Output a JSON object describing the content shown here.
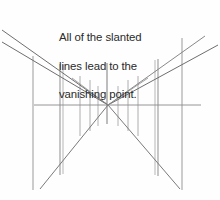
{
  "figure": {
    "background_color": "#fefefe",
    "width": 220,
    "height": 200
  },
  "caption": {
    "full_text": "All of the slanted lines lead to the vanishing point.",
    "lines": [
      "All of the slanted",
      "lines lead to the",
      "vanishing point."
    ],
    "color": "#2a2a2a",
    "font_size_px": 11.4
  },
  "chart_data": {
    "type": "diagram",
    "title": "All of the slanted lines lead to the vanishing point.",
    "vanishing_point": {
      "x": 108,
      "y": 105
    },
    "horizon_line": {
      "label": "horizon-line",
      "x1": 34,
      "y1": 105,
      "x2": 201,
      "y2": 105,
      "color": "#8a8a8a",
      "width": 0.9
    },
    "vertical_lines": [
      {
        "label": "vertical-far-left",
        "x": 33,
        "y1": 56,
        "y2": 190,
        "color": "#9a9a9a",
        "width": 1.0
      },
      {
        "label": "vertical-left-outer",
        "x": 60,
        "y1": 64,
        "y2": 175,
        "color": "#8f8f8f",
        "width": 1.0
      },
      {
        "label": "vertical-left-inner",
        "x": 63,
        "y1": 65,
        "y2": 174,
        "color": "#a5a5a5",
        "width": 0.8
      },
      {
        "label": "vertical-mid-left-a",
        "x": 80,
        "y1": 76,
        "y2": 136,
        "color": "#9a9a9a",
        "width": 0.8
      },
      {
        "label": "vertical-mid-left-b",
        "x": 90,
        "y1": 80,
        "y2": 131,
        "color": "#9a9a9a",
        "width": 0.8
      },
      {
        "label": "vertical-mid-left-c",
        "x": 98,
        "y1": 86,
        "y2": 126,
        "color": "#a0a0a0",
        "width": 0.8
      },
      {
        "label": "vertical-center",
        "x": 107,
        "y1": 63,
        "y2": 124,
        "color": "#7d7d7d",
        "width": 1.0
      },
      {
        "label": "vertical-mid-right-c",
        "x": 118,
        "y1": 86,
        "y2": 126,
        "color": "#a0a0a0",
        "width": 0.8
      },
      {
        "label": "vertical-mid-right-b",
        "x": 128,
        "y1": 80,
        "y2": 131,
        "color": "#9a9a9a",
        "width": 0.8
      },
      {
        "label": "vertical-mid-right-a",
        "x": 138,
        "y1": 76,
        "y2": 136,
        "color": "#9a9a9a",
        "width": 0.8
      },
      {
        "label": "vertical-right-inner",
        "x": 155,
        "y1": 60,
        "y2": 175,
        "color": "#a5a5a5",
        "width": 0.8
      },
      {
        "label": "vertical-right-outer",
        "x": 158,
        "y1": 59,
        "y2": 176,
        "color": "#8f8f8f",
        "width": 1.0
      },
      {
        "label": "vertical-far-right",
        "x": 182,
        "y1": 38,
        "y2": 190,
        "color": "#9a9a9a",
        "width": 1.0
      }
    ],
    "slanted_lines": [
      {
        "label": "slant-upper-left-1",
        "x1": 2,
        "y1": 30,
        "x2": 108,
        "y2": 105,
        "color": "#6e6e6e",
        "width": 1.0
      },
      {
        "label": "slant-upper-left-2",
        "x1": 2,
        "y1": 42,
        "x2": 108,
        "y2": 105,
        "color": "#6e6e6e",
        "width": 1.0
      },
      {
        "label": "slant-lower-left-1",
        "x1": 40,
        "y1": 189,
        "x2": 108,
        "y2": 105,
        "color": "#7a7a7a",
        "width": 1.0
      },
      {
        "label": "slant-upper-right-1",
        "x1": 218,
        "y1": 45,
        "x2": 108,
        "y2": 105,
        "color": "#6e6e6e",
        "width": 1.0
      },
      {
        "label": "slant-upper-right-2",
        "x1": 205,
        "y1": 36,
        "x2": 108,
        "y2": 105,
        "color": "#7a7a7a",
        "width": 0.9
      },
      {
        "label": "slant-lower-right-1",
        "x1": 180,
        "y1": 189,
        "x2": 108,
        "y2": 105,
        "color": "#7a7a7a",
        "width": 1.0
      },
      {
        "label": "slant-short-upleft",
        "x1": 72,
        "y1": 78,
        "x2": 108,
        "y2": 105,
        "color": "#8a8a8a",
        "width": 0.8
      },
      {
        "label": "slant-short-upright",
        "x1": 148,
        "y1": 78,
        "x2": 108,
        "y2": 105,
        "color": "#8a8a8a",
        "width": 0.8
      }
    ],
    "grid": false,
    "legend": null
  }
}
